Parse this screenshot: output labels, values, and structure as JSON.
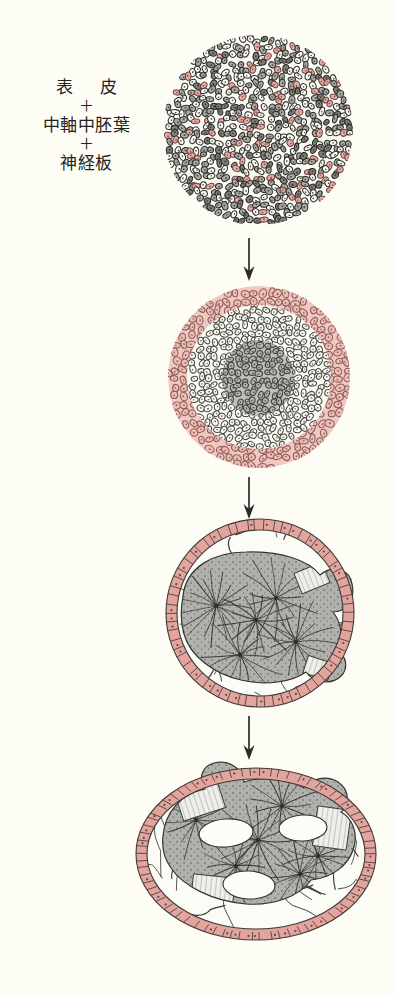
{
  "figure": {
    "background_color": "#fdfdf5",
    "ink_color": "#2b2b28",
    "pink_color": "#e2a49d",
    "pink_light_color": "#f0c9c4",
    "gray_color": "#9a9a97",
    "gray_light_color": "#c9c9c6",
    "white_cell_color": "#fbfbf6"
  },
  "caption": {
    "line1": "表　皮",
    "plus1": "＋",
    "line2": "中軸中胚葉",
    "plus2": "＋",
    "line3": "神経板"
  },
  "stages": [
    {
      "id": "stage-1",
      "name": "dissociated-mixed-cells",
      "shape": "circle",
      "cx": 258,
      "cy": 130,
      "rx": 95,
      "ry": 95,
      "zones": [
        {
          "name": "mixed-cell-mass",
          "fill": "mixed",
          "note": "randomly intermingled epidermis, axial mesoderm and neural plate cells"
        }
      ]
    },
    {
      "id": "stage-2",
      "name": "sorted-concentric-layers",
      "shape": "circle",
      "cx": 259,
      "cy": 377,
      "rx": 91,
      "ry": 91,
      "zones": [
        {
          "name": "outer-epidermis-ring",
          "fill": "pink"
        },
        {
          "name": "middle-neural-zone",
          "fill": "white"
        },
        {
          "name": "inner-mesoderm-core",
          "fill": "gray"
        }
      ]
    },
    {
      "id": "stage-3",
      "name": "organized-tissue-mass",
      "shape": "circle",
      "cx": 260,
      "cy": 613,
      "rx": 94,
      "ry": 94,
      "zones": [
        {
          "name": "epidermis-ring",
          "fill": "pink"
        },
        {
          "name": "loose-mesenchyme",
          "fill": "white"
        },
        {
          "name": "notochord-neural-mass",
          "fill": "gray"
        }
      ]
    },
    {
      "id": "stage-4",
      "name": "differentiated-ovoid-embryo",
      "shape": "ellipse",
      "cx": 256,
      "cy": 854,
      "rx": 120,
      "ry": 86,
      "zones": [
        {
          "name": "epidermis-ring",
          "fill": "pink"
        },
        {
          "name": "loose-mesenchyme",
          "fill": "white"
        },
        {
          "name": "central-differentiated-mass",
          "fill": "gray"
        },
        {
          "name": "lumen-cavity-1",
          "fill": "white"
        },
        {
          "name": "lumen-cavity-2",
          "fill": "white"
        },
        {
          "name": "lumen-cavity-3",
          "fill": "white"
        }
      ]
    }
  ],
  "arrows": [
    {
      "name": "arrow-stage1-to-stage2",
      "x": 249,
      "y_top": 238,
      "y_bottom": 280
    },
    {
      "name": "arrow-stage2-to-stage3",
      "x": 249,
      "y_top": 477,
      "y_bottom": 518
    },
    {
      "name": "arrow-stage3-to-stage4",
      "x": 249,
      "y_top": 716,
      "y_bottom": 760
    }
  ]
}
